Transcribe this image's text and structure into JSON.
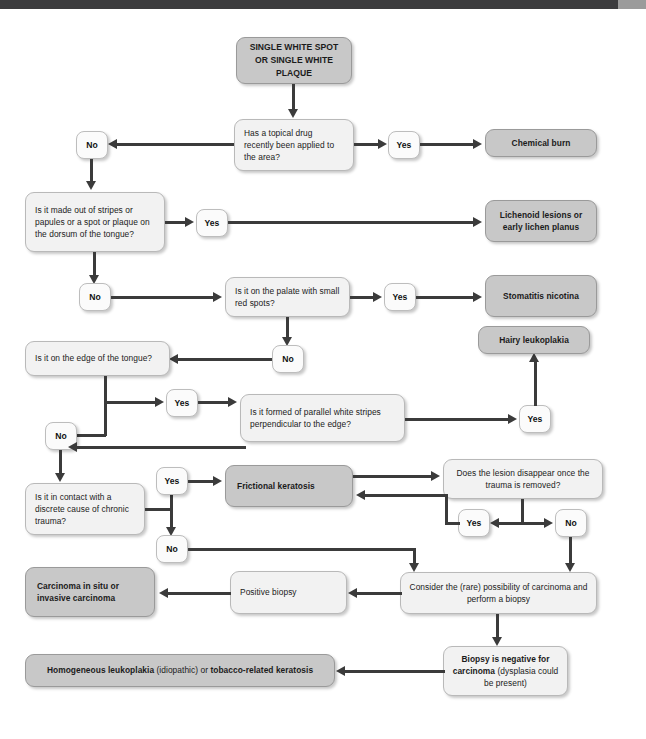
{
  "page": {
    "header_color": "#3c3c3e",
    "header_accent_color": "#9b9b9b",
    "question_box_color": "#f2f2f2",
    "result_box_color": "#c8c8c8",
    "connector_color": "#3b3b3b"
  },
  "nodes": {
    "start": "SINGLE WHITE SPOT OR SINGLE WHITE PLAQUE",
    "q_topical_drug": "Has a topical drug recently been applied to the area?",
    "r_chemical_burn": "Chemical burn",
    "q_stripes_papules": "Is it made out of stripes or papules or a spot or plaque on the dorsum of the tongue?",
    "r_lichenoid": "Lichenoid lesions or early lichen planus",
    "q_palate_red_spots": "Is it on the palate with small red spots?",
    "r_stomatitis": "Stomatitis nicotina",
    "q_edge_tongue": "Is it on the edge of the tongue?",
    "q_parallel_stripes": "Is it formed of parallel white stripes perpendicular to the edge?",
    "r_hairy_leukoplakia": "Hairy leukoplakia",
    "q_chronic_trauma": "Is it in contact with a discrete cause of chronic trauma?",
    "r_frictional_keratosis": "Frictional keratosis",
    "q_lesion_disappear": "Does the lesion disappear once the trauma is removed?",
    "a_consider_carcinoma": "Consider the (rare) possibility of carcinoma and perform a biopsy",
    "r_positive_biopsy": "Positive biopsy",
    "r_carcinoma": "Carcinoma in situ or invasive carcinoma",
    "r_biopsy_negative_bold": "Biopsy is negative for carcinoma",
    "r_biopsy_negative_rest": " (dysplasia could be present)",
    "r_homogeneous_bold_1": "Homogeneous leukoplakia",
    "r_homogeneous_mid": " (idiopathic) or ",
    "r_homogeneous_bold_2": "tobacco-related keratosis"
  },
  "labels": {
    "yes": "Yes",
    "no": "No"
  }
}
